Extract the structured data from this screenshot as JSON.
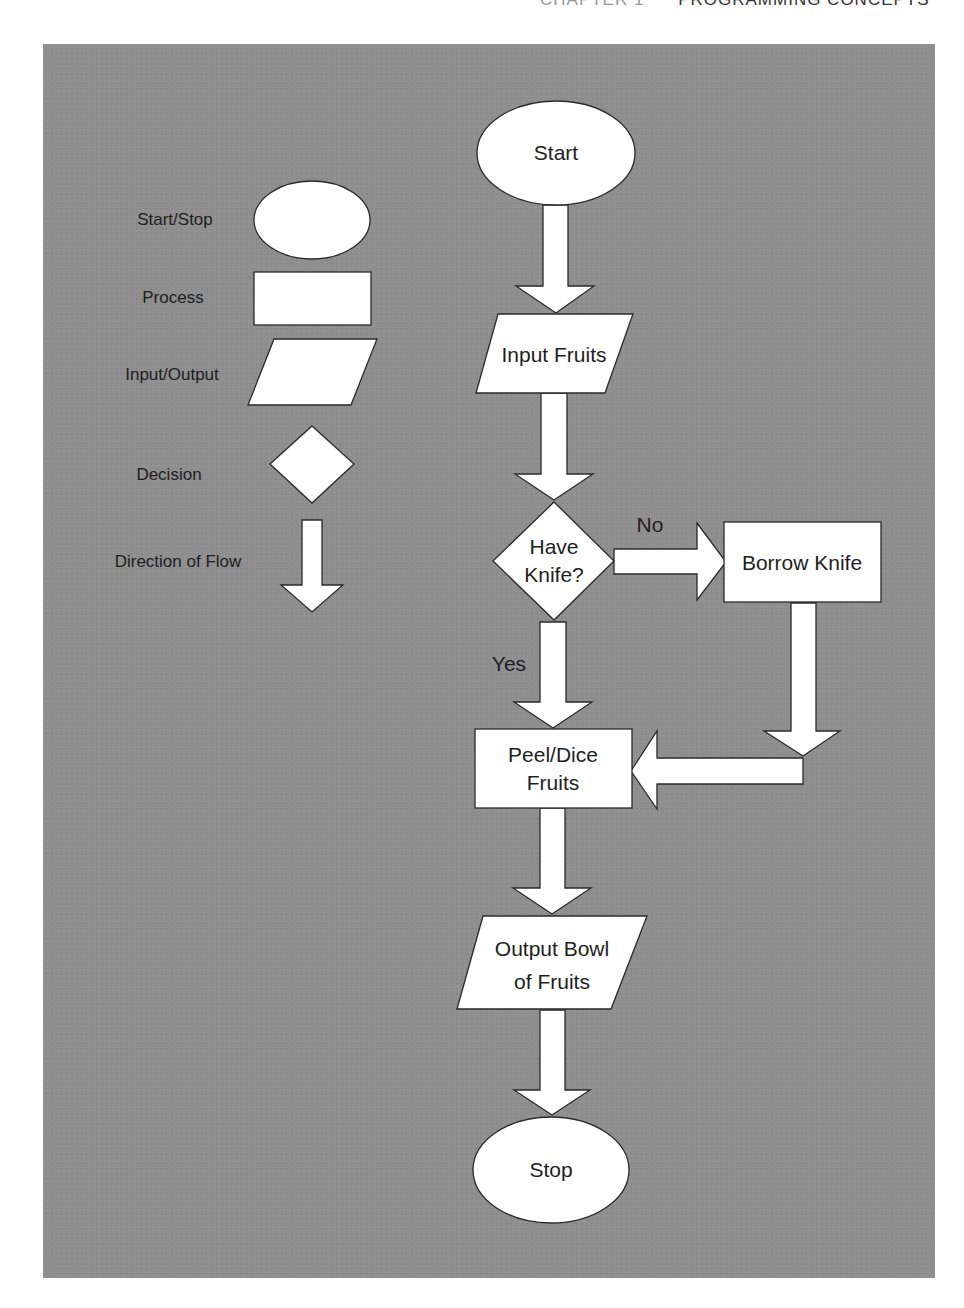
{
  "header": {
    "chapter": "CHAPTER 1",
    "title": "PROGRAMMING CONCEPTS"
  },
  "legend": {
    "items": [
      {
        "label": "Start/Stop",
        "shape": "ellipse"
      },
      {
        "label": "Process",
        "shape": "rectangle"
      },
      {
        "label": "Input/Output",
        "shape": "parallelogram"
      },
      {
        "label": "Decision",
        "shape": "diamond"
      },
      {
        "label": "Direction of Flow",
        "shape": "arrow-down"
      }
    ]
  },
  "flowchart": {
    "nodes": {
      "start": {
        "label": "Start",
        "shape": "ellipse"
      },
      "input_fruits": {
        "label": "Input Fruits",
        "shape": "parallelogram"
      },
      "have_knife": {
        "line1": "Have",
        "line2": "Knife?",
        "shape": "diamond"
      },
      "borrow_knife": {
        "label": "Borrow Knife",
        "shape": "rectangle"
      },
      "peel_dice": {
        "line1": "Peel/Dice",
        "line2": "Fruits",
        "shape": "rectangle"
      },
      "output_bowl": {
        "line1": "Output Bowl",
        "line2": "of Fruits",
        "shape": "parallelogram"
      },
      "stop": {
        "label": "Stop",
        "shape": "ellipse"
      }
    },
    "edges": {
      "no_label": "No",
      "yes_label": "Yes"
    }
  },
  "colors": {
    "panel_bg": "#8f8f8f",
    "shape_fill": "#ffffff",
    "stroke": "#2a2a2a",
    "text": "#1e1e1e"
  }
}
